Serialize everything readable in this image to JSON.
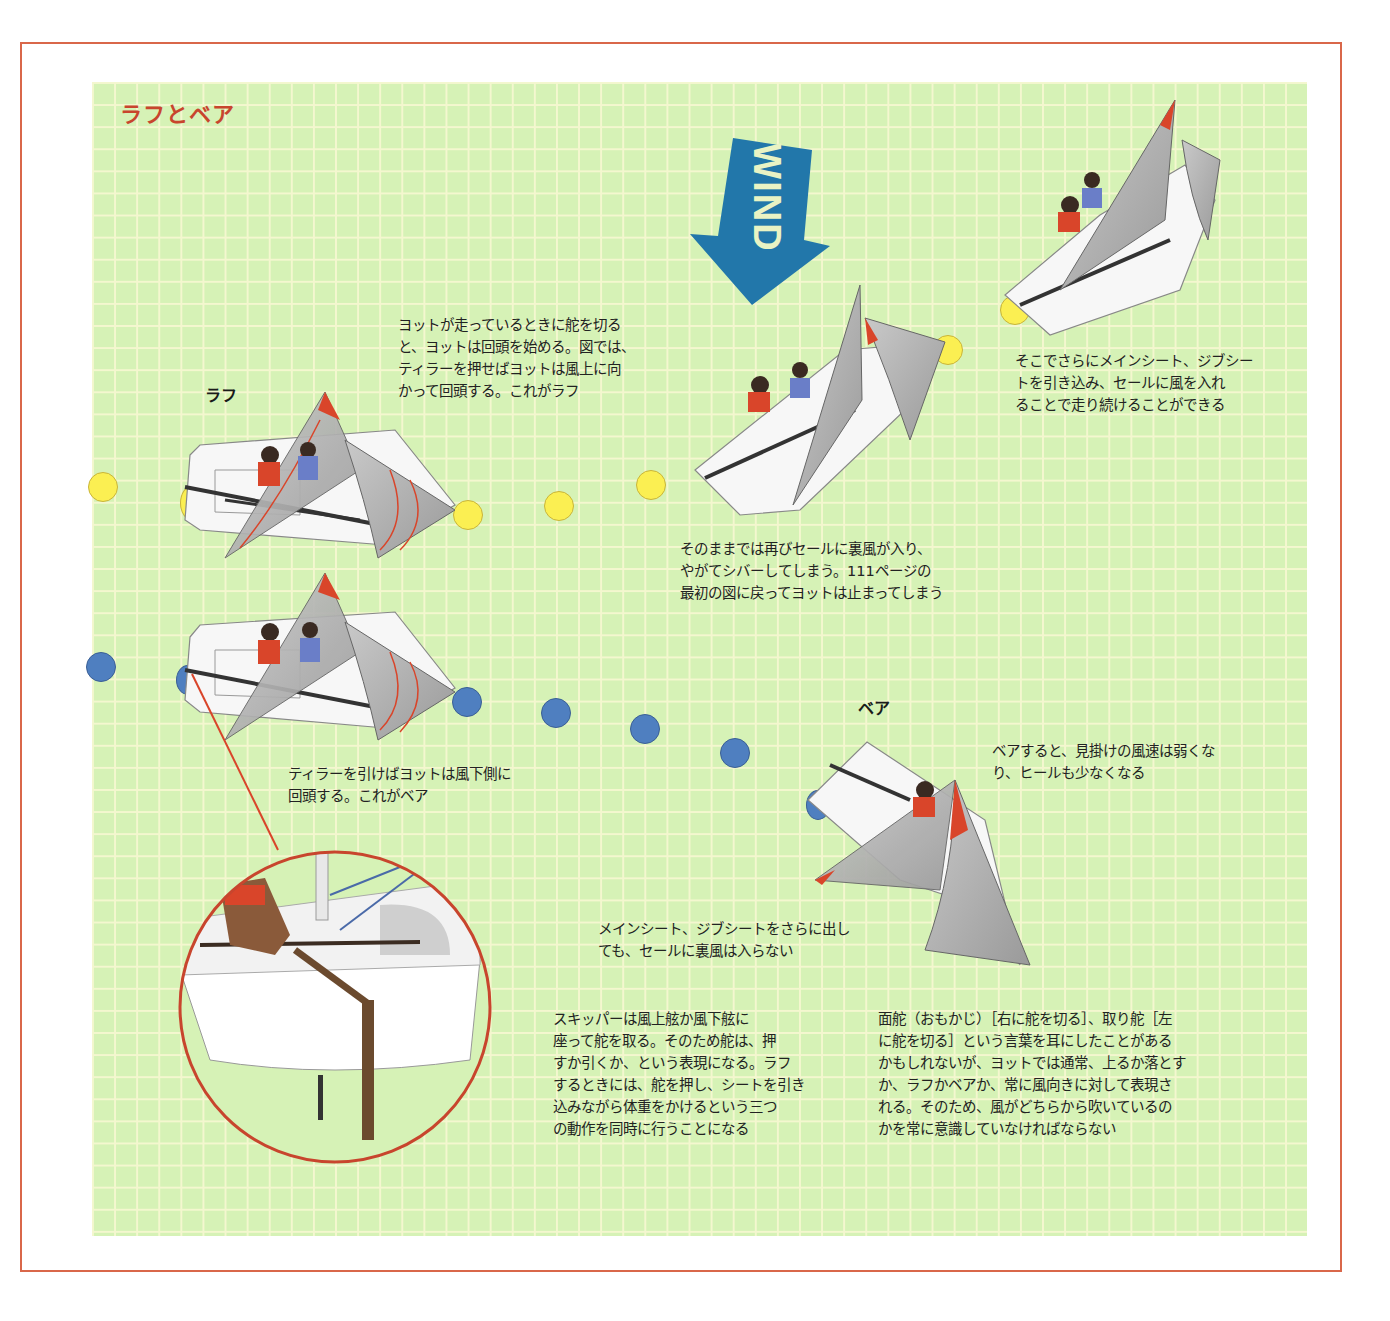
{
  "title": "ラフとベア",
  "colors": {
    "frame_border": "#d9674a",
    "grid_bg": "#d6f2b6",
    "grid_line": "#f4f7cf",
    "title": "#c8452d",
    "wind_arrow": "#2277aa",
    "wind_text": "#e9f3c4",
    "dot_yellow": "#fbef52",
    "dot_blue": "#4f7fc0",
    "sail_accent": "#d9452a"
  },
  "wind": {
    "label": "WIND",
    "icon": "wind-arrow-icon"
  },
  "labels": {
    "luff": "ラフ",
    "bear": "ベア"
  },
  "captions": {
    "luff_intro": "ヨットが走っているときに舵を切る\nと、ヨットは回頭を始める。図では、\nティラーを押せばヨットは風上に向\nかって回頭する。これがラフ",
    "keep_sailing": "そこでさらにメインシート、ジブシー\nトを引き込み、セールに風を入れ\nることで走り続けることができる",
    "shiver": "そのままでは再びセールに裏風が入り、\nやがてシバーしてしまう。111ページの\n最初の図に戻ってヨットは止まってしまう",
    "bear_intro": "ティラーを引けばヨットは風下側に\n回頭する。これがベア",
    "bear_result": "ベアすると、見掛けの風速は弱くな\nり、ヒールも少なくなる",
    "ease_sheets": "メインシート、ジブシートをさらに出し\nても、セールに裏風は入らない",
    "skipper": "スキッパーは風上舷か風下舷に\n座って舵を取る。そのため舵は、押\nすか引くか、という表現になる。ラフ\nするときには、舵を押し、シートを引き\n込みながら体重をかけるという三つ\nの動作を同時に行うことになる",
    "terms": "面舵（おもかじ）［右に舵を切る］、取り舵［左\nに舵を切る］という言葉を耳にしたことがある\nかもしれないが、ヨットでは通常、上るか落とす\nか、ラフかベアか、常に風向きに対して表現さ\nれる。そのため、風がどちらから吹いているの\nかを常に意識していなければならない"
  },
  "dots": {
    "yellow": [
      [
        88,
        472
      ],
      [
        453,
        500
      ],
      [
        544,
        491
      ],
      [
        636,
        470
      ],
      [
        933,
        335
      ],
      [
        1000,
        295
      ]
    ],
    "blue": [
      [
        86,
        652
      ],
      [
        452,
        687
      ],
      [
        541,
        698
      ],
      [
        630,
        714
      ],
      [
        720,
        738
      ]
    ]
  }
}
